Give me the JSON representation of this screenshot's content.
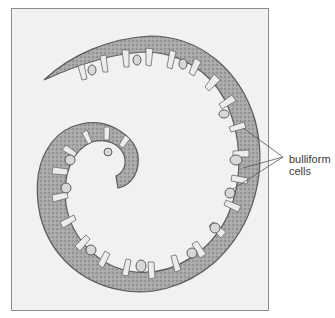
{
  "figure": {
    "label": {
      "line1": "bulliform",
      "line2": "cells"
    },
    "colors": {
      "frame_bg": "#f1f1f1",
      "frame_border": "#8c8c8c",
      "tissue_dark": "#6e6e6e",
      "tissue_mid": "#9a9a9a",
      "tissue_light": "#c9c9c9",
      "label_text": "#3a3a3a",
      "leader_line": "#555555"
    }
  }
}
